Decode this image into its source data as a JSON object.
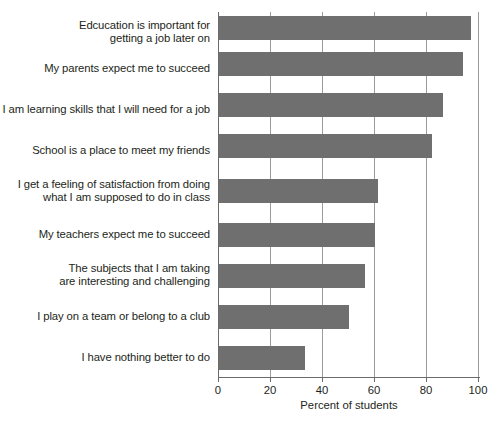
{
  "chart_data": {
    "type": "bar",
    "orientation": "horizontal",
    "title": "",
    "xlabel": "Percent of students",
    "ylabel": "",
    "xlim": [
      0,
      100
    ],
    "xticks": [
      0,
      20,
      40,
      60,
      80,
      100
    ],
    "grid": true,
    "legend": null,
    "bar_color": "#706f6f",
    "categories": [
      "Edcucation is important for\ngetting a job later on",
      "My parents expect me to succeed",
      "I am learning skills that I will need for a job",
      "School is a place to meet my friends",
      "I get a feeling of satisfaction from doing\nwhat I am supposed to do in class",
      "My teachers expect me to succeed",
      "The subjects that I am taking\nare interesting and challenging",
      "I play on a team or belong to a club",
      "I have nothing better to do"
    ],
    "values": [
      97,
      94,
      86,
      82,
      61,
      60,
      56,
      50,
      33
    ]
  },
  "axis": {
    "x_title": "Percent of students",
    "tick_labels": [
      "0",
      "20",
      "40",
      "60",
      "80",
      "100"
    ]
  }
}
